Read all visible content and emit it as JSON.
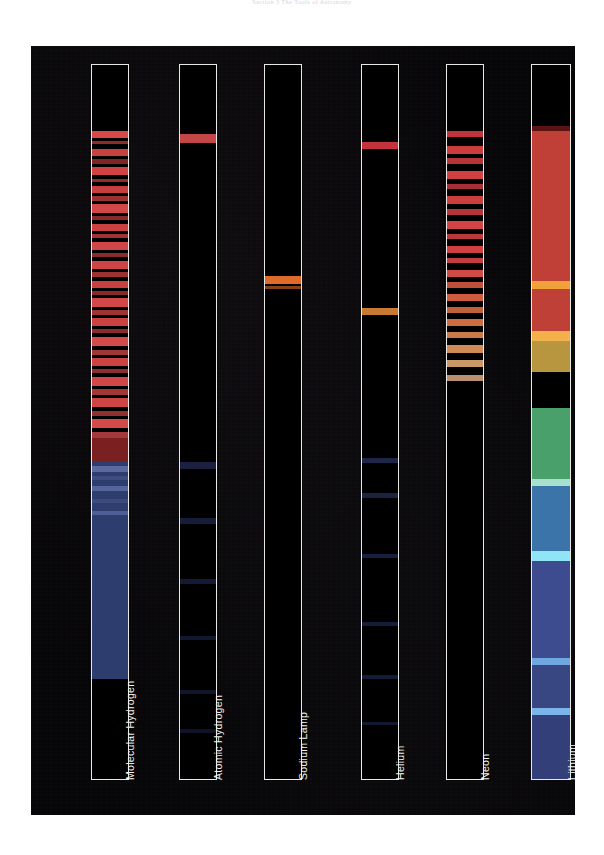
{
  "page": {
    "running_head": "Section 3   The Tools of Astronomy",
    "background_color": "#ffffff"
  },
  "figure": {
    "plate_color": "#050406",
    "frame_color": "#e8e8e4",
    "label_color": "#f2f2ee",
    "panels": [
      {
        "label": "Molecular Hydrogen",
        "type": "banded-emission",
        "x": 60,
        "width": 38,
        "continuum": [
          {
            "top": 52.0,
            "height": 3.5,
            "color": "#7a2020"
          },
          {
            "top": 55.5,
            "height": 30.5,
            "color": "#2d3d6e"
          },
          {
            "top": 86.0,
            "height": 10.0,
            "color": "#000000"
          }
        ],
        "lines": [
          {
            "top": 9.3,
            "h": 0.9,
            "color": "#d84848"
          },
          {
            "top": 10.6,
            "h": 0.5,
            "color": "#8d2a2a"
          },
          {
            "top": 11.8,
            "h": 1.0,
            "color": "#c94040"
          },
          {
            "top": 13.2,
            "h": 0.6,
            "color": "#7e2525"
          },
          {
            "top": 14.3,
            "h": 1.1,
            "color": "#d04343"
          },
          {
            "top": 15.9,
            "h": 0.5,
            "color": "#8f2c2c"
          },
          {
            "top": 16.9,
            "h": 1.0,
            "color": "#c73e3e"
          },
          {
            "top": 18.3,
            "h": 0.7,
            "color": "#9b3131"
          },
          {
            "top": 19.5,
            "h": 1.2,
            "color": "#d14646"
          },
          {
            "top": 21.1,
            "h": 0.6,
            "color": "#88292a"
          },
          {
            "top": 22.2,
            "h": 1.0,
            "color": "#c94141"
          },
          {
            "top": 23.6,
            "h": 0.7,
            "color": "#a03434"
          },
          {
            "top": 24.8,
            "h": 1.1,
            "color": "#d04545"
          },
          {
            "top": 26.3,
            "h": 0.6,
            "color": "#8a2b2b"
          },
          {
            "top": 27.4,
            "h": 1.2,
            "color": "#cf4444"
          },
          {
            "top": 29.0,
            "h": 0.7,
            "color": "#9c3131"
          },
          {
            "top": 30.2,
            "h": 1.0,
            "color": "#c84040"
          },
          {
            "top": 31.6,
            "h": 0.6,
            "color": "#872a2a"
          },
          {
            "top": 32.7,
            "h": 1.2,
            "color": "#d24747"
          },
          {
            "top": 34.3,
            "h": 0.7,
            "color": "#9e3333"
          },
          {
            "top": 35.5,
            "h": 1.1,
            "color": "#cb4242"
          },
          {
            "top": 37.0,
            "h": 0.6,
            "color": "#8b2c2c"
          },
          {
            "top": 38.1,
            "h": 1.3,
            "color": "#d44949"
          },
          {
            "top": 39.9,
            "h": 0.7,
            "color": "#a03535"
          },
          {
            "top": 41.1,
            "h": 1.1,
            "color": "#cc4343"
          },
          {
            "top": 42.6,
            "h": 0.6,
            "color": "#8d2d2d"
          },
          {
            "top": 43.7,
            "h": 1.2,
            "color": "#d14646"
          },
          {
            "top": 45.4,
            "h": 0.8,
            "color": "#a23737"
          },
          {
            "top": 46.7,
            "h": 1.2,
            "color": "#ce4545"
          },
          {
            "top": 48.4,
            "h": 0.7,
            "color": "#8f2f2f"
          },
          {
            "top": 49.6,
            "h": 1.3,
            "color": "#d34a4a"
          },
          {
            "top": 51.4,
            "h": 0.8,
            "color": "#a43939"
          },
          {
            "top": 56.2,
            "h": 0.8,
            "color": "#5a6aa0"
          },
          {
            "top": 57.6,
            "h": 0.5,
            "color": "#3f4d80"
          },
          {
            "top": 59.0,
            "h": 0.7,
            "color": "#55659b"
          },
          {
            "top": 60.8,
            "h": 0.5,
            "color": "#3c4a7c"
          },
          {
            "top": 62.4,
            "h": 0.6,
            "color": "#4f5f95"
          }
        ]
      },
      {
        "label": "Atomic Hydrogen",
        "type": "line-emission",
        "x": 148,
        "width": 38,
        "continuum": [],
        "lines": [
          {
            "top": 9.6,
            "h": 1.3,
            "color": "#c34747"
          },
          {
            "top": 55.6,
            "h": 1.0,
            "color": "#1b2040"
          },
          {
            "top": 63.5,
            "h": 0.8,
            "color": "#171c38"
          },
          {
            "top": 72.0,
            "h": 0.7,
            "color": "#141a33"
          },
          {
            "top": 80.0,
            "h": 0.6,
            "color": "#121730"
          },
          {
            "top": 87.5,
            "h": 0.6,
            "color": "#10152c"
          },
          {
            "top": 93.0,
            "h": 0.5,
            "color": "#0e1329"
          }
        ]
      },
      {
        "label": "Sodium Lamp",
        "type": "line-emission",
        "x": 233,
        "width": 38,
        "continuum": [],
        "lines": [
          {
            "top": 29.6,
            "h": 1.1,
            "color": "#e06a2a"
          },
          {
            "top": 30.9,
            "h": 0.5,
            "color": "#8a4016"
          }
        ]
      },
      {
        "label": "Helium",
        "type": "line-emission",
        "x": 330,
        "width": 38,
        "continuum": [],
        "lines": [
          {
            "top": 10.8,
            "h": 1.0,
            "color": "#c4333b"
          },
          {
            "top": 34.0,
            "h": 1.0,
            "color": "#c87a32"
          },
          {
            "top": 55.0,
            "h": 0.7,
            "color": "#1d2647"
          },
          {
            "top": 60.0,
            "h": 0.6,
            "color": "#1a2342"
          },
          {
            "top": 68.5,
            "h": 0.6,
            "color": "#172040"
          },
          {
            "top": 78.0,
            "h": 0.6,
            "color": "#151d3a"
          },
          {
            "top": 85.5,
            "h": 0.5,
            "color": "#131b36"
          },
          {
            "top": 92.0,
            "h": 0.5,
            "color": "#111932"
          }
        ]
      },
      {
        "label": "Neon",
        "type": "line-emission",
        "x": 415,
        "width": 38,
        "continuum": [],
        "lines": [
          {
            "top": 9.2,
            "h": 0.9,
            "color": "#c1333b"
          },
          {
            "top": 11.4,
            "h": 1.0,
            "color": "#cd3c3c"
          },
          {
            "top": 13.0,
            "h": 0.8,
            "color": "#b43438"
          },
          {
            "top": 14.8,
            "h": 1.1,
            "color": "#d04141"
          },
          {
            "top": 16.6,
            "h": 0.7,
            "color": "#a82f35"
          },
          {
            "top": 18.4,
            "h": 1.0,
            "color": "#cb3e3e"
          },
          {
            "top": 20.2,
            "h": 0.8,
            "color": "#b53639"
          },
          {
            "top": 21.9,
            "h": 1.1,
            "color": "#d24444"
          },
          {
            "top": 23.6,
            "h": 0.8,
            "color": "#bb393b"
          },
          {
            "top": 25.3,
            "h": 1.0,
            "color": "#cf4141"
          },
          {
            "top": 27.0,
            "h": 0.8,
            "color": "#c23d3d"
          },
          {
            "top": 28.7,
            "h": 1.0,
            "color": "#d24a44"
          },
          {
            "top": 30.4,
            "h": 0.8,
            "color": "#c0503a"
          },
          {
            "top": 32.1,
            "h": 1.0,
            "color": "#cf5b3e"
          },
          {
            "top": 33.9,
            "h": 0.8,
            "color": "#c2603c"
          },
          {
            "top": 35.6,
            "h": 1.0,
            "color": "#d06c42"
          },
          {
            "top": 37.4,
            "h": 0.9,
            "color": "#c97a46"
          },
          {
            "top": 39.2,
            "h": 1.1,
            "color": "#d18a55"
          },
          {
            "top": 41.3,
            "h": 1.0,
            "color": "#c99768"
          },
          {
            "top": 43.4,
            "h": 0.8,
            "color": "#b89070"
          }
        ]
      },
      {
        "label": "Lithium",
        "type": "continuum",
        "x": 500,
        "width": 40,
        "continuum": [
          {
            "top": 0.0,
            "height": 8.5,
            "color": "#000000"
          },
          {
            "top": 8.5,
            "height": 0.8,
            "color": "#5a1212"
          },
          {
            "top": 9.3,
            "height": 21.0,
            "color": "#c04038"
          },
          {
            "top": 30.3,
            "height": 1.1,
            "color": "#f0a23a"
          },
          {
            "top": 31.4,
            "height": 5.9,
            "color": "#bf4036"
          },
          {
            "top": 37.3,
            "height": 1.3,
            "color": "#f4b04a"
          },
          {
            "top": 38.6,
            "height": 4.4,
            "color": "#b8953f"
          },
          {
            "top": 43.0,
            "height": 5.0,
            "color": "#8aa martial"
          },
          {
            "top": 48.0,
            "height": 10.0,
            "color": "#49a06a"
          },
          {
            "top": 58.0,
            "height": 1.0,
            "color": "#a8e0d0"
          },
          {
            "top": 59.0,
            "height": 9.0,
            "color": "#3b74a8"
          },
          {
            "top": 68.0,
            "height": 1.4,
            "color": "#8fe4f6"
          },
          {
            "top": 69.4,
            "height": 13.6,
            "color": "#3d4c8e"
          },
          {
            "top": 83.0,
            "height": 1.0,
            "color": "#6fa8e0"
          },
          {
            "top": 84.0,
            "height": 6.0,
            "color": "#384682"
          },
          {
            "top": 90.0,
            "height": 1.0,
            "color": "#7ab4e8"
          },
          {
            "top": 91.0,
            "height": 9.0,
            "color": "#333f78"
          }
        ],
        "lines": []
      }
    ]
  }
}
